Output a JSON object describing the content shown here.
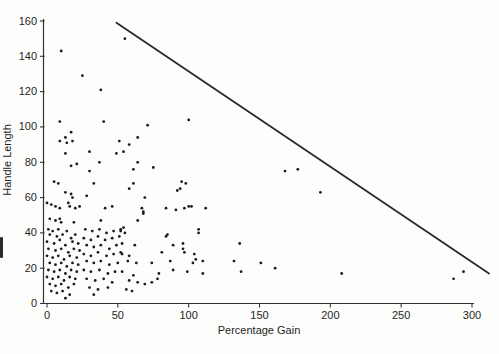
{
  "chart_data": {
    "type": "scatter",
    "title": "",
    "xlabel": "Percentage Gain",
    "ylabel": "Handle Length",
    "xlim": [
      0,
      310
    ],
    "ylim": [
      0,
      165
    ],
    "x_ticks": [
      0,
      50,
      100,
      150,
      200,
      250,
      300
    ],
    "y_ticks": [
      0,
      20,
      40,
      60,
      80,
      100,
      120,
      140,
      160
    ],
    "grid": false,
    "legend": "none",
    "point_color": "#1c1c1c",
    "line_color": "#2a2a2a",
    "axis_color": "#333333",
    "frontier_line": {
      "x1": 49,
      "y1": 159,
      "x2": 312,
      "y2": 17
    },
    "points": [
      [
        55,
        150
      ],
      [
        10,
        143
      ],
      [
        25,
        129
      ],
      [
        38,
        121
      ],
      [
        9,
        103
      ],
      [
        40,
        103
      ],
      [
        71,
        101
      ],
      [
        100,
        104
      ],
      [
        17,
        97
      ],
      [
        13,
        94
      ],
      [
        9,
        92
      ],
      [
        14,
        91
      ],
      [
        18,
        92
      ],
      [
        51,
        92
      ],
      [
        58,
        90
      ],
      [
        64,
        94
      ],
      [
        13,
        85
      ],
      [
        30,
        86
      ],
      [
        49,
        85
      ],
      [
        54,
        86
      ],
      [
        17,
        78
      ],
      [
        21,
        79
      ],
      [
        37,
        80
      ],
      [
        30,
        75
      ],
      [
        5,
        69
      ],
      [
        8,
        68
      ],
      [
        33,
        68
      ],
      [
        13,
        63
      ],
      [
        17,
        62
      ],
      [
        18,
        60
      ],
      [
        28,
        61
      ],
      [
        0,
        57
      ],
      [
        3,
        56
      ],
      [
        6,
        55
      ],
      [
        9,
        54
      ],
      [
        15,
        57
      ],
      [
        16,
        55
      ],
      [
        20,
        54
      ],
      [
        23,
        55
      ],
      [
        41,
        54
      ],
      [
        46,
        55
      ],
      [
        2,
        48
      ],
      [
        6,
        47
      ],
      [
        9,
        48
      ],
      [
        10,
        46
      ],
      [
        19,
        46
      ],
      [
        38,
        47
      ],
      [
        54,
        43
      ],
      [
        52,
        41
      ],
      [
        55,
        40
      ],
      [
        64,
        80
      ],
      [
        61,
        76
      ],
      [
        75,
        77
      ],
      [
        61,
        68
      ],
      [
        58,
        65
      ],
      [
        95,
        69
      ],
      [
        92,
        64
      ],
      [
        94,
        65
      ],
      [
        98,
        68
      ],
      [
        69,
        60
      ],
      [
        84,
        54
      ],
      [
        91,
        53
      ],
      [
        97,
        54
      ],
      [
        100,
        55
      ],
      [
        102,
        55
      ],
      [
        112,
        54
      ],
      [
        67,
        54
      ],
      [
        68,
        52
      ],
      [
        68,
        51
      ],
      [
        64,
        47
      ],
      [
        107,
        42
      ],
      [
        85,
        39
      ],
      [
        168,
        75
      ],
      [
        177,
        76
      ],
      [
        193,
        63
      ],
      [
        136,
        34
      ],
      [
        105,
        25
      ],
      [
        110,
        24
      ],
      [
        110,
        17
      ],
      [
        132,
        24
      ],
      [
        137,
        18
      ],
      [
        151,
        23
      ],
      [
        161,
        20
      ],
      [
        208,
        17
      ],
      [
        287,
        14
      ],
      [
        294,
        18
      ],
      [
        107,
        40
      ],
      [
        84,
        38
      ],
      [
        53,
        34
      ],
      [
        62,
        33
      ],
      [
        89,
        33
      ],
      [
        96,
        34
      ],
      [
        53,
        28
      ],
      [
        58,
        27
      ],
      [
        81,
        29
      ],
      [
        96,
        31
      ],
      [
        97,
        29
      ],
      [
        104,
        28
      ],
      [
        57,
        24
      ],
      [
        63,
        23
      ],
      [
        74,
        23
      ],
      [
        87,
        24
      ],
      [
        103,
        23
      ],
      [
        53,
        18
      ],
      [
        61,
        16
      ],
      [
        79,
        17
      ],
      [
        89,
        19
      ],
      [
        99,
        18
      ],
      [
        58,
        13
      ],
      [
        64,
        12
      ],
      [
        69,
        11
      ],
      [
        74,
        12
      ],
      [
        78,
        14
      ],
      [
        56,
        8
      ],
      [
        60,
        7
      ],
      [
        1,
        42
      ],
      [
        4,
        41
      ],
      [
        8,
        42
      ],
      [
        14,
        41
      ],
      [
        2,
        39
      ],
      [
        7,
        38
      ],
      [
        11,
        39
      ],
      [
        17,
        37
      ],
      [
        20,
        39
      ],
      [
        0,
        35
      ],
      [
        5,
        34
      ],
      [
        9,
        36
      ],
      [
        13,
        33
      ],
      [
        18,
        35
      ],
      [
        22,
        34
      ],
      [
        1,
        31
      ],
      [
        6,
        30
      ],
      [
        10,
        31
      ],
      [
        15,
        29
      ],
      [
        19,
        31
      ],
      [
        23,
        30
      ],
      [
        0,
        27
      ],
      [
        4,
        26
      ],
      [
        8,
        27
      ],
      [
        12,
        25
      ],
      [
        16,
        27
      ],
      [
        21,
        26
      ],
      [
        2,
        23
      ],
      [
        6,
        22
      ],
      [
        10,
        23
      ],
      [
        14,
        21
      ],
      [
        18,
        23
      ],
      [
        22,
        22
      ],
      [
        1,
        19
      ],
      [
        5,
        18
      ],
      [
        9,
        19
      ],
      [
        13,
        17
      ],
      [
        17,
        19
      ],
      [
        21,
        18
      ],
      [
        0,
        15
      ],
      [
        4,
        14
      ],
      [
        8,
        15
      ],
      [
        12,
        13
      ],
      [
        16,
        15
      ],
      [
        20,
        14
      ],
      [
        2,
        11
      ],
      [
        6,
        10
      ],
      [
        10,
        11
      ],
      [
        15,
        9
      ],
      [
        19,
        11
      ],
      [
        3,
        7
      ],
      [
        7,
        6
      ],
      [
        11,
        7
      ],
      [
        16,
        5
      ],
      [
        13,
        3
      ],
      [
        27,
        42
      ],
      [
        32,
        41
      ],
      [
        37,
        42
      ],
      [
        42,
        40
      ],
      [
        47,
        41
      ],
      [
        52,
        42
      ],
      [
        26,
        37
      ],
      [
        31,
        36
      ],
      [
        36,
        38
      ],
      [
        41,
        36
      ],
      [
        46,
        37
      ],
      [
        51,
        38
      ],
      [
        28,
        33
      ],
      [
        33,
        32
      ],
      [
        38,
        33
      ],
      [
        44,
        31
      ],
      [
        49,
        33
      ],
      [
        26,
        28
      ],
      [
        31,
        27
      ],
      [
        36,
        29
      ],
      [
        42,
        27
      ],
      [
        47,
        28
      ],
      [
        52,
        29
      ],
      [
        28,
        24
      ],
      [
        33,
        23
      ],
      [
        38,
        24
      ],
      [
        44,
        22
      ],
      [
        50,
        23
      ],
      [
        26,
        19
      ],
      [
        31,
        18
      ],
      [
        37,
        19
      ],
      [
        43,
        17
      ],
      [
        48,
        18
      ],
      [
        28,
        14
      ],
      [
        34,
        13
      ],
      [
        40,
        14
      ],
      [
        46,
        12
      ],
      [
        30,
        9
      ],
      [
        36,
        8
      ],
      [
        43,
        9
      ],
      [
        33,
        5
      ]
    ],
    "layout": {
      "width": 499,
      "height": 354,
      "x0_px": 47,
      "x_scale": 1.4167,
      "y0_px": 303.5,
      "y_scale": 1.7656,
      "axis_x_px": 43.5,
      "axis_top_px": 19,
      "xlabel_x_px": 259,
      "xlabel_y_px": 334,
      "ylabel_x_px": 11,
      "ylabel_y_px": 160
    }
  }
}
